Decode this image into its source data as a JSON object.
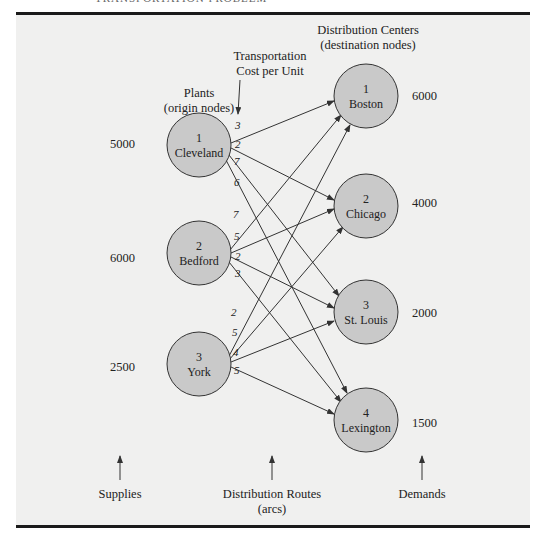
{
  "header": {
    "text": "TRANSPORTATION PROBLEM"
  },
  "labels": {
    "plants_title": "Plants",
    "plants_subtitle": "(origin nodes)",
    "cost_title": "Transportation",
    "cost_subtitle": "Cost per Unit",
    "dc_title": "Distribution Centers",
    "dc_subtitle": "(destination nodes)",
    "supplies": "Supplies",
    "routes_title": "Distribution Routes",
    "routes_subtitle": "(arcs)",
    "demands": "Demands"
  },
  "origins": [
    {
      "id": "1",
      "name": "Cleveland",
      "supply": "5000"
    },
    {
      "id": "2",
      "name": "Bedford",
      "supply": "6000"
    },
    {
      "id": "3",
      "name": "York",
      "supply": "2500"
    }
  ],
  "destinations": [
    {
      "id": "1",
      "name": "Boston",
      "demand": "6000"
    },
    {
      "id": "2",
      "name": "Chicago",
      "demand": "4000"
    },
    {
      "id": "3",
      "name": "St. Louis",
      "demand": "2000"
    },
    {
      "id": "4",
      "name": "Lexington",
      "demand": "1500"
    }
  ],
  "costs": {
    "cleveland_boston": "3",
    "cleveland_chicago": "2",
    "cleveland_stlouis": "7",
    "cleveland_lexington": "6",
    "bedford_boston": "7",
    "bedford_chicago": "5",
    "bedford_stlouis": "2",
    "bedford_lexington": "3",
    "york_boston": "2",
    "york_chicago": "5",
    "york_stlouis": "4",
    "york_lexington": "5"
  },
  "colors": {
    "node_fill": "#c9c9c9",
    "panel_bg": "#f0f0ef",
    "line": "#333333"
  }
}
